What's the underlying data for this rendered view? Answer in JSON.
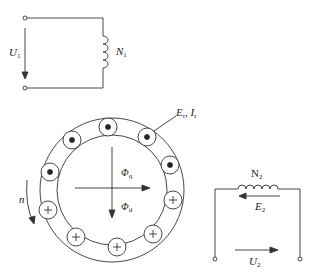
{
  "primary": {
    "voltage_label": "U",
    "voltage_sub": "1",
    "winding_label": "N",
    "winding_sub": "1"
  },
  "rotor": {
    "emf_current_label": "E",
    "emf_current_sub": "r",
    "current_label": "I",
    "current_sub": "r",
    "flux_q_label": "Φ",
    "flux_q_sub": "q",
    "flux_d_label": "Φ",
    "flux_d_sub": "d",
    "speed_label": "n",
    "dot_conductors": 5,
    "cross_conductors": 5
  },
  "secondary": {
    "winding_label": "N",
    "winding_sub": "2",
    "emf_label": "E",
    "emf_sub": "2",
    "voltage_label": "U",
    "voltage_sub": "2"
  },
  "colors": {
    "line": "#333333",
    "background": "#ffffff"
  }
}
